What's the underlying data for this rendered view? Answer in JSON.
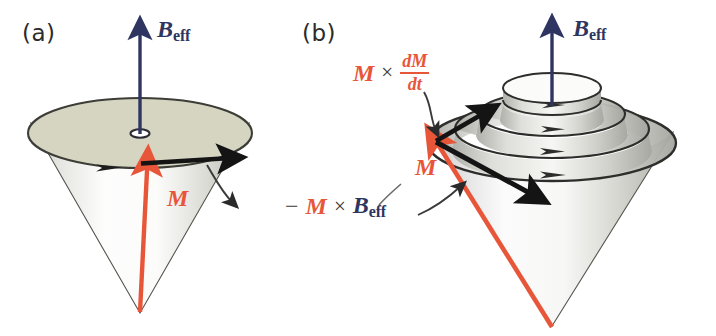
{
  "figure": {
    "type": "physics-diagram",
    "width": 716,
    "height": 336,
    "background_color": "#ffffff"
  },
  "colors": {
    "field_vector": "#2e3560",
    "magnetization_vector": "#e8563a",
    "torque_arrow": "#1a1a1a",
    "cone_outline": "#4a4a46",
    "cone_top_fill": "#d6d5c2",
    "cone_body_light": "#fcfcfc",
    "cone_body_shade": "#b9b9b4",
    "leader_line": "#3a3a3a",
    "text_dark": "#2b2b2b"
  },
  "panels": [
    {
      "id": "a",
      "label": "(a)",
      "caption_meaning": "Undamped precession: M sweeps a fixed cone about B_eff",
      "labels": {
        "field": {
          "symbol": "B",
          "subscript": "eff"
        },
        "magnetization": {
          "symbol": "M"
        },
        "torque": {
          "minus": "−",
          "symbol_m": "M",
          "operator": "×",
          "symbol_b": "B",
          "subscript_b": "eff",
          "full_text": "−M × B_eff"
        }
      }
    },
    {
      "id": "b",
      "label": "(b)",
      "caption_meaning": "Damped precession: M spirals inward toward B_eff",
      "labels": {
        "field": {
          "symbol": "B",
          "subscript": "eff"
        },
        "magnetization": {
          "symbol": "M"
        },
        "damping": {
          "symbol_m": "M",
          "operator": "×",
          "numerator": "dM",
          "denominator": "dt",
          "full_text": "M × dM/dt"
        }
      },
      "spiral_turns": 4
    }
  ],
  "annotations": {
    "arrow_count_panel_b_flow": 4,
    "cone_half_angle_deg": 35
  }
}
